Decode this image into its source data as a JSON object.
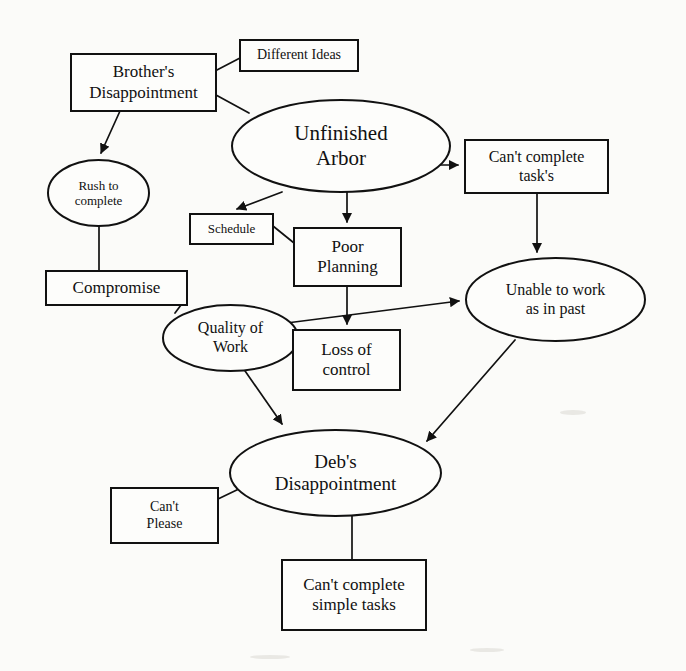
{
  "diagram": {
    "background_color": "#fbfbf9",
    "stroke_color": "#111111",
    "nodes": [
      {
        "id": "different-ideas",
        "label": "Different Ideas",
        "shape": "rectangle",
        "x": 240,
        "y": 40,
        "w": 118,
        "h": 31,
        "font_size": 14
      },
      {
        "id": "brothers-disappointment",
        "label": "Brother's\nDisappointment",
        "shape": "rectangle",
        "x": 71,
        "y": 54,
        "w": 145,
        "h": 57,
        "font_size": 17
      },
      {
        "id": "unfinished-arbor",
        "label": "Unfinished\nArbor",
        "shape": "ellipse",
        "x": 232,
        "y": 100,
        "w": 218,
        "h": 92,
        "font_size": 21
      },
      {
        "id": "cant-complete-tasks",
        "label": "Can't complete\ntask's",
        "shape": "rectangle",
        "x": 465,
        "y": 140,
        "w": 143,
        "h": 53,
        "font_size": 16
      },
      {
        "id": "rush-to-complete",
        "label": "Rush to\ncomplete",
        "shape": "ellipse",
        "x": 48,
        "y": 160,
        "w": 101,
        "h": 66,
        "font_size": 13
      },
      {
        "id": "schedule",
        "label": "Schedule",
        "shape": "rectangle",
        "x": 190,
        "y": 214,
        "w": 83,
        "h": 30,
        "font_size": 13
      },
      {
        "id": "poor-planning",
        "label": "Poor\nPlanning",
        "shape": "rectangle",
        "x": 294,
        "y": 228,
        "w": 107,
        "h": 58,
        "font_size": 17
      },
      {
        "id": "compromise",
        "label": "Compromise",
        "shape": "rectangle",
        "x": 46,
        "y": 271,
        "w": 141,
        "h": 34,
        "font_size": 17
      },
      {
        "id": "unable-to-work",
        "label": "Unable to work\nas in past",
        "shape": "ellipse",
        "x": 466,
        "y": 258,
        "w": 179,
        "h": 83,
        "font_size": 16
      },
      {
        "id": "quality-of-work",
        "label": "Quality of\nWork",
        "shape": "ellipse",
        "x": 163,
        "y": 305,
        "w": 135,
        "h": 66,
        "font_size": 16
      },
      {
        "id": "loss-of-control",
        "label": "Loss of\ncontrol",
        "shape": "rectangle",
        "x": 293,
        "y": 330,
        "w": 107,
        "h": 60,
        "font_size": 17
      },
      {
        "id": "debs-disappointment",
        "label": "Deb's\nDisappointment",
        "shape": "ellipse",
        "x": 230,
        "y": 430,
        "w": 211,
        "h": 86,
        "font_size": 19
      },
      {
        "id": "cant-please",
        "label": "Can't\nPlease",
        "shape": "rectangle",
        "x": 111,
        "y": 488,
        "w": 107,
        "h": 55,
        "font_size": 14
      },
      {
        "id": "cant-complete-simple-tasks",
        "label": "Can't complete\nsimple tasks",
        "shape": "rectangle",
        "x": 282,
        "y": 560,
        "w": 144,
        "h": 70,
        "font_size": 17
      }
    ],
    "edges": [
      {
        "id": "different-ideas-to-brothers",
        "from": "different-ideas",
        "to": "brothers-disappointment",
        "arrow": false
      },
      {
        "id": "brothers-to-unfinished-arbor",
        "from": "brothers-disappointment",
        "to": "unfinished-arbor",
        "arrow": false
      },
      {
        "id": "brothers-to-rush",
        "from": "brothers-disappointment",
        "to": "rush-to-complete",
        "arrow": true
      },
      {
        "id": "unfinished-arbor-to-cant-complete-tasks",
        "from": "unfinished-arbor",
        "to": "cant-complete-tasks",
        "arrow": true
      },
      {
        "id": "unfinished-arbor-to-schedule",
        "from": "unfinished-arbor",
        "to": "schedule",
        "arrow": true
      },
      {
        "id": "unfinished-arbor-to-poor-planning",
        "from": "unfinished-arbor",
        "to": "poor-planning",
        "arrow": true
      },
      {
        "id": "schedule-to-poor-planning",
        "from": "schedule",
        "to": "poor-planning",
        "arrow": false
      },
      {
        "id": "cant-complete-tasks-to-unable-to-work",
        "from": "cant-complete-tasks",
        "to": "unable-to-work",
        "arrow": true
      },
      {
        "id": "rush-to-compromise",
        "from": "rush-to-complete",
        "to": "compromise",
        "arrow": false
      },
      {
        "id": "compromise-to-quality-of-work",
        "from": "compromise",
        "to": "quality-of-work",
        "arrow": false
      },
      {
        "id": "poor-planning-to-loss-of-control",
        "from": "poor-planning",
        "to": "loss-of-control",
        "arrow": true
      },
      {
        "id": "quality-of-work-to-loss-of-control",
        "from": "quality-of-work",
        "to": "loss-of-control",
        "arrow": false
      },
      {
        "id": "quality-of-work-to-unable-to-work",
        "from": "quality-of-work",
        "to": "unable-to-work",
        "arrow": true
      },
      {
        "id": "quality-of-work-to-debs",
        "from": "quality-of-work",
        "to": "debs-disappointment",
        "arrow": true
      },
      {
        "id": "unable-to-work-to-debs",
        "from": "unable-to-work",
        "to": "debs-disappointment",
        "arrow": true
      },
      {
        "id": "cant-please-to-debs",
        "from": "cant-please",
        "to": "debs-disappointment",
        "arrow": false
      },
      {
        "id": "debs-to-cant-complete-simple-tasks",
        "from": "debs-disappointment",
        "to": "cant-complete-simple-tasks",
        "arrow": false
      }
    ]
  }
}
